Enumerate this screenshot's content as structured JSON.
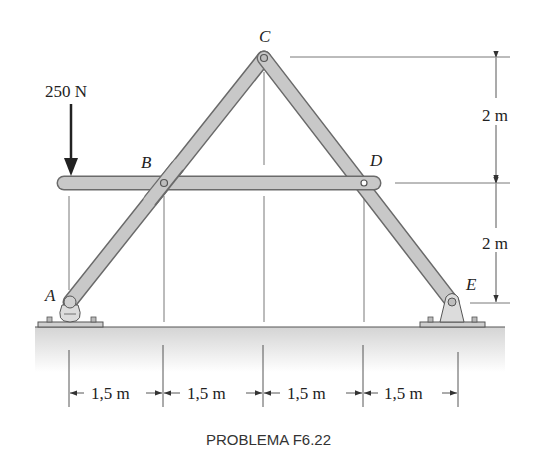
{
  "figure": {
    "caption": "PROBLEMA F6.22",
    "load": {
      "label": "250 N",
      "point": "left end of beam BD"
    },
    "joints": {
      "A": "A",
      "B": "B",
      "C": "C",
      "D": "D",
      "E": "E"
    },
    "horizontal_dims": [
      "1,5 m",
      "1,5 m",
      "1,5 m",
      "1,5 m"
    ],
    "vertical_dims": [
      "2 m",
      "2 m"
    ],
    "colors": {
      "member": "#c8c8c8",
      "member_edge": "#6a6a6a",
      "ground": "#d6d6d6",
      "line": "#444444"
    }
  }
}
